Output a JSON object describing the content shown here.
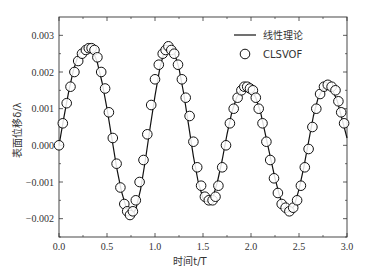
{
  "chart_data": {
    "type": "line",
    "title": "",
    "xlabel": "时间t/T",
    "ylabel": "表面位移δ/λ",
    "xlim": [
      0.0,
      3.0
    ],
    "ylim": [
      -0.0025,
      0.0035
    ],
    "xticks": [
      0.0,
      0.5,
      1.0,
      1.5,
      2.0,
      2.5,
      3.0
    ],
    "xtick_labels": [
      "0.0",
      "0.5",
      "1.0",
      "1.5",
      "2.0",
      "2.5",
      "3.0"
    ],
    "yticks": [
      -0.002,
      -0.001,
      0.0,
      0.001,
      0.002,
      0.003
    ],
    "ytick_labels": [
      "-0.002",
      "-0.001",
      "0.000",
      "0.001",
      "0.002",
      "0.003"
    ],
    "grid": false,
    "legend_position": "upper right",
    "series": [
      {
        "name": "线性理论",
        "style": "line",
        "color": "#111111",
        "x": [
          0.0,
          0.05,
          0.1,
          0.15,
          0.2,
          0.25,
          0.3,
          0.35,
          0.4,
          0.45,
          0.5,
          0.55,
          0.6,
          0.65,
          0.7,
          0.75,
          0.8,
          0.85,
          0.9,
          0.95,
          1.0,
          1.05,
          1.1,
          1.15,
          1.2,
          1.25,
          1.3,
          1.35,
          1.4,
          1.45,
          1.5,
          1.55,
          1.6,
          1.65,
          1.7,
          1.75,
          1.8,
          1.85,
          1.9,
          1.95,
          2.0,
          2.05,
          2.1,
          2.15,
          2.2,
          2.25,
          2.3,
          2.35,
          2.4,
          2.45,
          2.5,
          2.55,
          2.6,
          2.65,
          2.7,
          2.75,
          2.8,
          2.85,
          2.9,
          2.95,
          3.0
        ],
        "values": [
          0.0,
          0.00075,
          0.00145,
          0.00205,
          0.00245,
          0.00265,
          0.0027,
          0.0026,
          0.00225,
          0.0017,
          0.001,
          0.0002,
          -0.0006,
          -0.00125,
          -0.0017,
          -0.0019,
          -0.00175,
          -0.0012,
          -0.0004,
          0.0005,
          0.00135,
          0.0021,
          0.0026,
          0.0027,
          0.00255,
          0.0021,
          0.0014,
          0.00055,
          -0.0003,
          -0.001,
          -0.00145,
          -0.00155,
          -0.00145,
          -0.001,
          -0.0004,
          0.0003,
          0.0009,
          0.0013,
          0.00155,
          0.0016,
          0.00155,
          0.0013,
          0.0009,
          0.0003,
          -0.0003,
          -0.0009,
          -0.0014,
          -0.00175,
          -0.0018,
          -0.00165,
          -0.0012,
          -0.0006,
          0.0001,
          0.0008,
          0.0013,
          0.00155,
          0.0016,
          0.0015,
          0.0012,
          0.0007,
          0.0002
        ]
      },
      {
        "name": "CLSVOF",
        "style": "open-circle",
        "color": "#111111",
        "x": [
          0.0,
          0.04,
          0.08,
          0.12,
          0.16,
          0.2,
          0.24,
          0.28,
          0.31,
          0.34,
          0.37,
          0.4,
          0.44,
          0.48,
          0.52,
          0.56,
          0.6,
          0.64,
          0.68,
          0.71,
          0.74,
          0.77,
          0.8,
          0.84,
          0.88,
          0.92,
          0.96,
          1.0,
          1.04,
          1.08,
          1.11,
          1.14,
          1.17,
          1.2,
          1.24,
          1.28,
          1.32,
          1.36,
          1.4,
          1.44,
          1.48,
          1.52,
          1.56,
          1.6,
          1.63,
          1.66,
          1.7,
          1.74,
          1.78,
          1.82,
          1.86,
          1.9,
          1.93,
          1.96,
          1.99,
          2.02,
          2.05,
          2.08,
          2.12,
          2.16,
          2.2,
          2.24,
          2.28,
          2.32,
          2.36,
          2.4,
          2.44,
          2.48,
          2.52,
          2.56,
          2.6,
          2.64,
          2.68,
          2.72,
          2.76,
          2.8,
          2.84,
          2.88,
          2.91,
          2.94,
          2.97
        ],
        "values": [
          0.0,
          0.0006,
          0.00115,
          0.0016,
          0.002,
          0.0023,
          0.0025,
          0.0026,
          0.00265,
          0.00265,
          0.0026,
          0.0024,
          0.002,
          0.00155,
          0.0009,
          0.0002,
          -0.0005,
          -0.00115,
          -0.0016,
          -0.0018,
          -0.0019,
          -0.0018,
          -0.0015,
          -0.001,
          -0.0004,
          0.0003,
          0.0011,
          0.0018,
          0.0022,
          0.0025,
          0.0026,
          0.0027,
          0.0026,
          0.0025,
          0.0022,
          0.0018,
          0.0013,
          0.0008,
          0.0001,
          -0.0006,
          -0.0011,
          -0.0014,
          -0.0015,
          -0.0015,
          -0.0014,
          -0.0011,
          -0.0006,
          0.0,
          0.0006,
          0.001,
          0.0013,
          0.0015,
          0.0016,
          0.0016,
          0.00155,
          0.0015,
          0.0013,
          0.001,
          0.0006,
          0.0001,
          -0.0004,
          -0.0009,
          -0.0013,
          -0.0016,
          -0.0017,
          -0.0018,
          -0.0017,
          -0.0015,
          -0.0011,
          -0.0006,
          -0.0001,
          0.0005,
          0.001,
          0.0014,
          0.0016,
          0.00165,
          0.0016,
          0.0015,
          0.0012,
          0.0009,
          0.0006
        ]
      }
    ]
  }
}
